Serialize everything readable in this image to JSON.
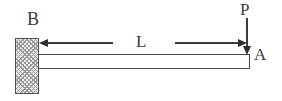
{
  "diagram": {
    "type": "engineering-schematic",
    "labels": {
      "fixed_end": "B",
      "free_end": "A",
      "span_length": "L",
      "point_load": "P"
    },
    "elements": {
      "support": "fixed wall support with crosshatch at left end B",
      "beam": "horizontal prismatic beam from B to A",
      "dimension": "length L measured from wall face to free end, arrows pointing outward",
      "load": "downward force P applied at free end A"
    },
    "colors": {
      "background": "#ffffff",
      "line": "#3b3b3b",
      "arrowhead": "#2e2e2e",
      "beam_fill": "#ffffff",
      "hatch_fill": "#ececec",
      "hatch_stroke": "#9a9a9a"
    }
  }
}
